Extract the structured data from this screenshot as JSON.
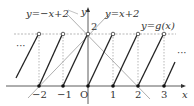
{
  "diagram": {
    "labels": {
      "line_neg": "y=−x+2",
      "line_pos": "y=x+2",
      "g_func": "y=g(x)",
      "y_axis": "y",
      "x_axis": "x",
      "origin": "O",
      "y_tick_2": "2",
      "ellipsis_left": "···",
      "ellipsis_right": "···"
    },
    "x_ticks": [
      {
        "value": -2,
        "label": "−2"
      },
      {
        "value": -1,
        "label": "−1"
      },
      {
        "value": 1,
        "label": "1"
      },
      {
        "value": 2,
        "label": "2"
      },
      {
        "value": 3,
        "label": "3"
      }
    ],
    "g_segments": [
      {
        "from": [
          -3,
          0
        ],
        "to": [
          -2,
          2
        ]
      },
      {
        "from": [
          -2,
          0
        ],
        "to": [
          -1,
          2
        ]
      },
      {
        "from": [
          -1,
          0
        ],
        "to": [
          0,
          2
        ]
      },
      {
        "from": [
          0,
          0
        ],
        "to": [
          1,
          2
        ]
      },
      {
        "from": [
          1,
          0
        ],
        "to": [
          2,
          2
        ]
      },
      {
        "from": [
          2,
          0
        ],
        "to": [
          3,
          2
        ]
      },
      {
        "from": [
          3,
          0
        ],
        "to": [
          3.5,
          1
        ]
      }
    ],
    "colors": {
      "axis": "#333333",
      "curve": "#222222",
      "aux_line": "#999999",
      "dashed": "#888888"
    }
  }
}
